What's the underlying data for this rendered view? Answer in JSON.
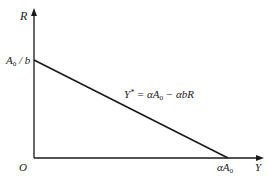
{
  "diagram": {
    "type": "line-diagram",
    "axes": {
      "x_label": "Y",
      "y_label": "R",
      "origin_label": "O"
    },
    "ticks": {
      "y_intercept": {
        "base": "A",
        "sub": "0",
        "rest": " / b"
      },
      "x_intercept": {
        "prefix": "αA",
        "sub": "0"
      }
    },
    "curve": {
      "equation": {
        "lhs": "Y",
        "lhs_sup": "*",
        "mid": " = αA",
        "mid_sub": "0",
        "rhs": " − αbR"
      },
      "from": {
        "x": 0,
        "y": "A0/b"
      },
      "to": {
        "x": "αA0",
        "y": 0
      }
    },
    "colors": {
      "line": "#1a1a1a",
      "background": "#ffffff"
    }
  }
}
